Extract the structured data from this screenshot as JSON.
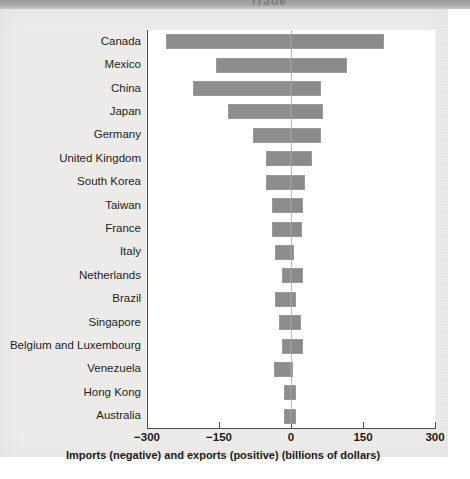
{
  "page": {
    "running_head_fragment": "Trade"
  },
  "chart_data": {
    "type": "bar",
    "orientation": "horizontal",
    "style": "diverging",
    "title": "",
    "xlabel": "Imports (negative) and exports (positive) (billions of dollars)",
    "ylabel": "",
    "xlim": [
      -300,
      300
    ],
    "xticks": [
      -300,
      -150,
      0,
      150,
      300
    ],
    "xticklabels": [
      "−300",
      "−150",
      "0",
      "150",
      "300"
    ],
    "grid": false,
    "legend": "none",
    "zero_reference_line": true,
    "bar_color": "#8b8b8b",
    "categories": [
      "Canada",
      "Mexico",
      "China",
      "Japan",
      "Germany",
      "United Kingdom",
      "South Korea",
      "Taiwan",
      "France",
      "Italy",
      "Netherlands",
      "Brazil",
      "Singapore",
      "Belgium and Luxembourg",
      "Venezuela",
      "Hong Kong",
      "Australia"
    ],
    "series": [
      {
        "name": "Imports (negative)",
        "values": [
          -260,
          -157,
          -205,
          -132,
          -79,
          -53,
          -53,
          -40,
          -40,
          -33,
          -18,
          -33,
          -24,
          -18,
          -35,
          -15,
          -15
        ]
      },
      {
        "name": "Exports (positive)",
        "values": [
          194,
          117,
          62,
          66,
          62,
          44,
          29,
          26,
          22,
          7,
          26,
          11,
          20,
          24,
          2,
          11,
          11
        ]
      }
    ]
  }
}
